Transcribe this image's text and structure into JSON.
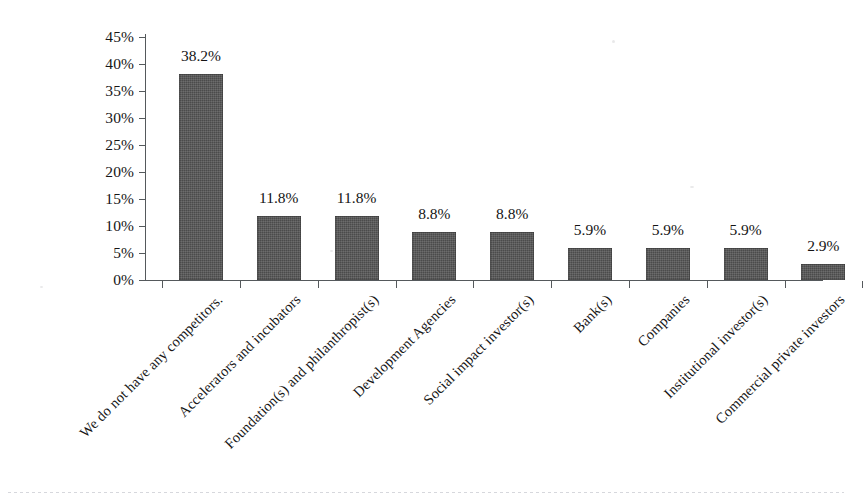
{
  "chart_data": {
    "type": "bar",
    "title": "",
    "subtitle": "",
    "xlabel": "",
    "ylabel": "",
    "ylim": [
      0,
      45
    ],
    "ytick_step": 5,
    "grid": false,
    "legend": false,
    "orientation": "vertical",
    "bar_color": "#4b4b4b",
    "categories": [
      "We do not have any competitors.",
      "Accelerators and incubators",
      "Foundation(s) and philanthropist(s)",
      "Development Agencies",
      "Social impact investor(s)",
      "Bank(s)",
      "Companies",
      "Institutional investor(s)",
      "Commercial private investors"
    ],
    "values": [
      38.2,
      11.8,
      11.8,
      8.8,
      8.8,
      5.9,
      5.9,
      5.9,
      2.9
    ],
    "value_labels": [
      "38.2%",
      "11.8%",
      "11.8%",
      "8.8%",
      "8.8%",
      "5.9%",
      "5.9%",
      "5.9%",
      "2.9%"
    ],
    "ytick_labels": [
      "45%",
      "40%",
      "35%",
      "30%",
      "25%",
      "20%",
      "15%",
      "10%",
      "5%",
      "0%"
    ],
    "ytick_values": [
      45,
      40,
      35,
      30,
      25,
      20,
      15,
      10,
      5,
      0
    ]
  }
}
